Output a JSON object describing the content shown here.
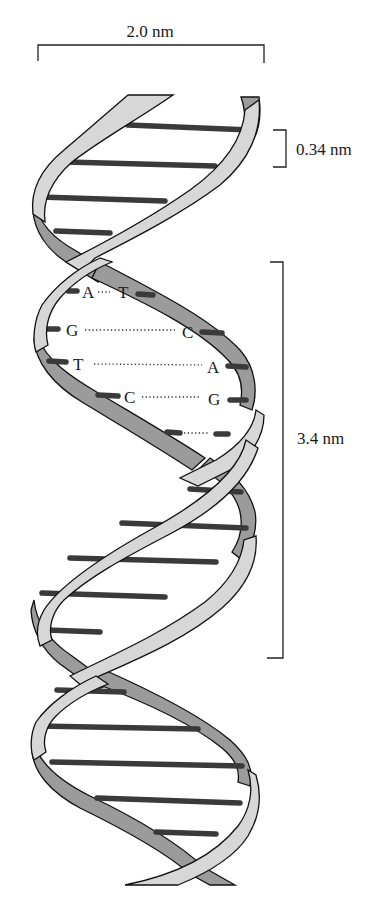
{
  "figure": {
    "colors": {
      "light_strand": "#d7d7d7",
      "dark_strand": "#9b9b9b",
      "base_pair_bar": "#3a3a3a",
      "outline": "#111111",
      "background": "#ffffff"
    }
  },
  "dimensions": {
    "width_label": "2.0 nm",
    "base_spacing_label": "0.34 nm",
    "helical_turn_label": "3.4 nm"
  },
  "base_pairs": [
    {
      "left": "A",
      "right": "T",
      "bonds": 2
    },
    {
      "left": "G",
      "right": "C",
      "bonds": 3
    },
    {
      "left": "T",
      "right": "A",
      "bonds": 2
    },
    {
      "left": "C",
      "right": "G",
      "bonds": 3
    }
  ]
}
